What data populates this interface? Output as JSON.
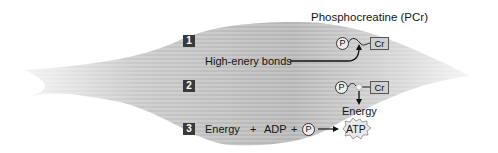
{
  "title": "Phosphocreatine (PCr)",
  "colors": {
    "muscle_light": "#e6e6e6",
    "muscle_mid": "#bdbdbd",
    "muscle_dark": "#9a9a9a",
    "step_box": "#3a3a3a",
    "cr_box": "#cfcfcf",
    "text": "#151515"
  },
  "steps": [
    {
      "number": "1",
      "annotation": "High-enery bonds",
      "molecule": {
        "phosphate": "P",
        "creatine": "Cr"
      }
    },
    {
      "number": "2",
      "molecule": {
        "phosphate": "P",
        "creatine": "Cr"
      },
      "product": "Energy"
    },
    {
      "number": "3",
      "equation": {
        "term1": "Energy",
        "plus1": "+",
        "term2": "ADP",
        "plus2": "+",
        "term3": "P",
        "product": "ATP"
      }
    }
  ]
}
